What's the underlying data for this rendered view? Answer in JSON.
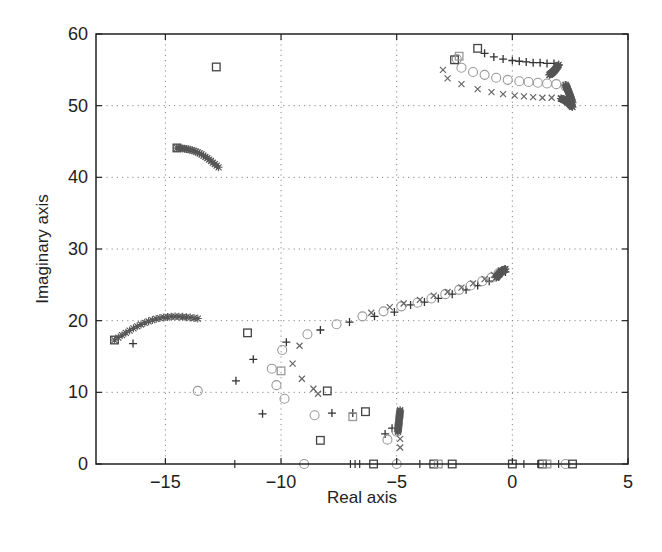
{
  "chart_data": {
    "type": "scatter",
    "title": "",
    "xlabel": "Real axis",
    "ylabel": "Imaginary axis",
    "xlim": [
      -18,
      5
    ],
    "ylim": [
      0,
      60
    ],
    "xticks": [
      -15,
      -10,
      -5,
      0,
      5
    ],
    "xtick_labels": [
      "−15",
      "−10",
      "−5",
      "0",
      "5"
    ],
    "yticks": [
      0,
      10,
      20,
      30,
      40,
      50,
      60
    ],
    "ytick_labels": [
      "0",
      "10",
      "20",
      "30",
      "40",
      "50",
      "60"
    ],
    "grid": true,
    "legend": null,
    "colors": {
      "plus": "#333333",
      "circle": "#999999",
      "cross": "#666666",
      "square": "#444444",
      "square_light": "#9a9a9a",
      "star": "#555555",
      "axis": "#222222",
      "grid": "#888888"
    },
    "series": [
      {
        "name": "plus",
        "marker": "+",
        "points": [
          [
            -16.4,
            16.8
          ],
          [
            -11.95,
            11.6
          ],
          [
            -11.2,
            14.6
          ],
          [
            -10.8,
            7.0
          ],
          [
            -9.77,
            17.0
          ],
          [
            -8.3,
            18.7
          ],
          [
            -7.8,
            7.1
          ],
          [
            -7.04,
            19.8
          ],
          [
            -6.9,
            7.1
          ],
          [
            -5.96,
            20.6
          ],
          [
            -5.5,
            4.2
          ],
          [
            -5.1,
            21.2
          ],
          [
            -5.2,
            5.0
          ],
          [
            -4.4,
            22.2
          ],
          [
            -3.8,
            22.6
          ],
          [
            -3.2,
            23.1
          ],
          [
            -2.6,
            23.7
          ],
          [
            -2.0,
            24.3
          ],
          [
            -1.5,
            24.9
          ],
          [
            -1.0,
            25.5
          ],
          [
            -0.6,
            26.1
          ],
          [
            -0.3,
            26.8
          ],
          [
            -1.2,
            57.3
          ],
          [
            -0.8,
            56.8
          ],
          [
            -0.4,
            56.5
          ],
          [
            0.0,
            56.3
          ],
          [
            0.3,
            56.2
          ],
          [
            0.6,
            56.1
          ],
          [
            0.9,
            56.0
          ],
          [
            1.2,
            56.0
          ],
          [
            1.5,
            55.9
          ],
          [
            1.8,
            55.9
          ],
          [
            2.0,
            55.7
          ]
        ]
      },
      {
        "name": "circle",
        "marker": "o",
        "points": [
          [
            -13.6,
            10.2
          ],
          [
            -10.4,
            13.3
          ],
          [
            -10.2,
            11.0
          ],
          [
            -9.95,
            15.9
          ],
          [
            -9.85,
            9.1
          ],
          [
            -8.86,
            18.1
          ],
          [
            -8.55,
            6.8
          ],
          [
            -7.6,
            19.5
          ],
          [
            -6.48,
            20.6
          ],
          [
            -5.57,
            21.3
          ],
          [
            -5.4,
            3.4
          ],
          [
            -5.0,
            4.5
          ],
          [
            -4.8,
            22.0
          ],
          [
            -4.1,
            22.5
          ],
          [
            -3.5,
            23.1
          ],
          [
            -2.9,
            23.7
          ],
          [
            -2.3,
            24.3
          ],
          [
            -1.8,
            24.9
          ],
          [
            -1.3,
            25.5
          ],
          [
            -0.9,
            26.0
          ],
          [
            -0.6,
            26.6
          ],
          [
            -2.4,
            56.5
          ],
          [
            -2.2,
            55.3
          ],
          [
            -1.7,
            54.7
          ],
          [
            -1.2,
            54.3
          ],
          [
            -0.7,
            53.9
          ],
          [
            -0.2,
            53.6
          ],
          [
            0.3,
            53.4
          ],
          [
            0.7,
            53.3
          ],
          [
            1.1,
            53.2
          ],
          [
            1.5,
            53.1
          ],
          [
            1.9,
            53.0
          ],
          [
            2.3,
            52.7
          ],
          [
            -9.0,
            0
          ],
          [
            -5.0,
            0
          ],
          [
            2.3,
            0
          ]
        ]
      },
      {
        "name": "cross",
        "marker": "x",
        "points": [
          [
            -9.5,
            14.0
          ],
          [
            -9.2,
            16.5
          ],
          [
            -9.1,
            11.9
          ],
          [
            -8.6,
            10.5
          ],
          [
            -8.4,
            9.8
          ],
          [
            -6.1,
            21.1
          ],
          [
            -5.3,
            21.9
          ],
          [
            -4.85,
            3.5
          ],
          [
            -4.85,
            2.3
          ],
          [
            -4.7,
            22.4
          ],
          [
            -4.0,
            22.9
          ],
          [
            -3.4,
            23.5
          ],
          [
            -2.8,
            24.0
          ],
          [
            -2.2,
            24.6
          ],
          [
            -1.7,
            25.2
          ],
          [
            -1.2,
            25.8
          ],
          [
            -0.8,
            26.4
          ],
          [
            -0.5,
            27.0
          ],
          [
            -3.0,
            55.0
          ],
          [
            -2.8,
            53.8
          ],
          [
            -2.2,
            53.0
          ],
          [
            -1.5,
            52.3
          ],
          [
            -0.9,
            51.9
          ],
          [
            -0.4,
            51.6
          ],
          [
            0.1,
            51.4
          ],
          [
            0.5,
            51.3
          ],
          [
            0.9,
            51.2
          ],
          [
            1.3,
            51.1
          ],
          [
            1.7,
            51.1
          ],
          [
            2.1,
            51.0
          ]
        ]
      },
      {
        "name": "square",
        "marker": "s",
        "points": [
          [
            -12.8,
            55.4
          ],
          [
            -14.5,
            44.1
          ],
          [
            -17.2,
            17.3
          ],
          [
            -11.45,
            18.3
          ],
          [
            -8.0,
            10.2
          ],
          [
            -8.3,
            3.3
          ],
          [
            -6.35,
            7.3
          ],
          [
            -1.5,
            58.0
          ],
          [
            -2.5,
            56.4
          ],
          [
            -6.0,
            0
          ],
          [
            -3.4,
            0
          ],
          [
            -2.6,
            0
          ],
          [
            0.0,
            0
          ],
          [
            1.3,
            0
          ],
          [
            2.6,
            0
          ]
        ]
      },
      {
        "name": "square_light",
        "marker": "s",
        "points": [
          [
            -10.0,
            13.0
          ],
          [
            -6.9,
            6.6
          ],
          [
            -3.2,
            0
          ],
          [
            1.5,
            0
          ],
          [
            -2.3,
            56.9
          ]
        ]
      },
      {
        "name": "dense_arcs",
        "marker": "*",
        "arcs": [
          {
            "from": [
              -14.5,
              44.1
            ],
            "to": [
              -12.7,
              41.4
            ]
          },
          {
            "from": [
              -17.2,
              17.3
            ],
            "to": [
              -13.6,
              20.3
            ]
          },
          {
            "from": [
              -4.95,
              4.5
            ],
            "to": [
              -4.85,
              7.5
            ]
          },
          {
            "from": [
              -0.7,
              26.0
            ],
            "to": [
              -0.3,
              27.2
            ]
          },
          {
            "from": [
              2.0,
              55.7
            ],
            "to": [
              1.6,
              54.3
            ]
          },
          {
            "from": [
              2.3,
              52.9
            ],
            "to": [
              2.6,
              50.4
            ]
          },
          {
            "from": [
              2.1,
              51.0
            ],
            "to": [
              2.6,
              49.8
            ]
          }
        ]
      },
      {
        "name": "real_axis_ticks",
        "marker": "|",
        "points": [
          [
            -12.0,
            0
          ],
          [
            -7.0,
            0
          ],
          [
            -6.8,
            0
          ],
          [
            -6.6,
            0
          ],
          [
            -4.0,
            0
          ],
          [
            0.5,
            0
          ],
          [
            1.1,
            0
          ],
          [
            2.0,
            0
          ]
        ]
      }
    ]
  }
}
